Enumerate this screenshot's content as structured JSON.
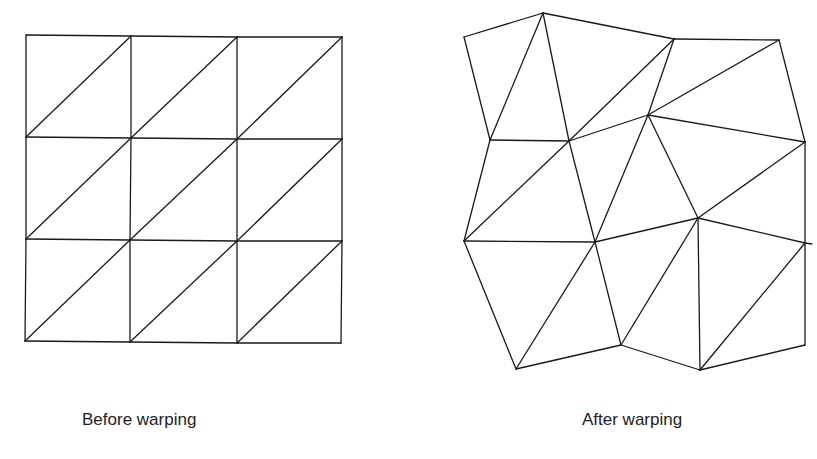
{
  "figure": {
    "panels": [
      {
        "id": "before",
        "caption": "Before warping",
        "vertices": [
          [
            26,
            35
          ],
          [
            131,
            36
          ],
          [
            237,
            37
          ],
          [
            342,
            37
          ],
          [
            26,
            137
          ],
          [
            131,
            138
          ],
          [
            237,
            139
          ],
          [
            342,
            139
          ],
          [
            26,
            239
          ],
          [
            130,
            240
          ],
          [
            237,
            241
          ],
          [
            342,
            241
          ],
          [
            25,
            341
          ],
          [
            130,
            342
          ],
          [
            237,
            343
          ],
          [
            341,
            343
          ]
        ],
        "edges": [
          [
            0,
            1
          ],
          [
            1,
            2
          ],
          [
            2,
            3
          ],
          [
            4,
            5
          ],
          [
            5,
            6
          ],
          [
            6,
            7
          ],
          [
            8,
            9
          ],
          [
            9,
            10
          ],
          [
            10,
            11
          ],
          [
            12,
            13
          ],
          [
            13,
            14
          ],
          [
            14,
            15
          ],
          [
            0,
            4
          ],
          [
            4,
            8
          ],
          [
            8,
            12
          ],
          [
            1,
            5
          ],
          [
            5,
            9
          ],
          [
            9,
            13
          ],
          [
            2,
            6
          ],
          [
            6,
            10
          ],
          [
            10,
            14
          ],
          [
            3,
            7
          ],
          [
            7,
            11
          ],
          [
            11,
            15
          ],
          [
            4,
            1
          ],
          [
            5,
            2
          ],
          [
            6,
            3
          ],
          [
            8,
            5
          ],
          [
            9,
            6
          ],
          [
            10,
            7
          ],
          [
            12,
            9
          ],
          [
            13,
            10
          ],
          [
            14,
            11
          ]
        ]
      },
      {
        "id": "after",
        "caption": "After warping",
        "vertices": [
          [
            464,
            37
          ],
          [
            543,
            13
          ],
          [
            674,
            39
          ],
          [
            779,
            40
          ],
          [
            490,
            140
          ],
          [
            569,
            141
          ],
          [
            648,
            115
          ],
          [
            805,
            142
          ],
          [
            464,
            241
          ],
          [
            595,
            242
          ],
          [
            698,
            218
          ],
          [
            805,
            243
          ],
          [
            516,
            369
          ],
          [
            621,
            345
          ],
          [
            700,
            370
          ],
          [
            805,
            345
          ]
        ],
        "edges": [
          [
            0,
            1
          ],
          [
            1,
            2
          ],
          [
            2,
            3
          ],
          [
            4,
            5
          ],
          [
            5,
            6
          ],
          [
            6,
            7
          ],
          [
            8,
            9
          ],
          [
            9,
            10
          ],
          [
            10,
            11
          ],
          [
            12,
            13
          ],
          [
            13,
            14
          ],
          [
            14,
            15
          ],
          [
            0,
            4
          ],
          [
            4,
            8
          ],
          [
            8,
            12
          ],
          [
            1,
            5
          ],
          [
            5,
            9
          ],
          [
            9,
            13
          ],
          [
            2,
            6
          ],
          [
            6,
            10
          ],
          [
            10,
            14
          ],
          [
            3,
            7
          ],
          [
            7,
            11
          ],
          [
            11,
            15
          ],
          [
            4,
            1
          ],
          [
            5,
            2
          ],
          [
            6,
            3
          ],
          [
            8,
            5
          ],
          [
            9,
            6
          ],
          [
            10,
            7
          ],
          [
            12,
            9
          ],
          [
            13,
            10
          ],
          [
            14,
            11
          ]
        ],
        "extra_ticks": [
          [
            [
              805,
              243
            ],
            [
              812,
              244
            ]
          ]
        ]
      }
    ],
    "stroke_color": "#1a1a1a",
    "background": "#ffffff"
  }
}
